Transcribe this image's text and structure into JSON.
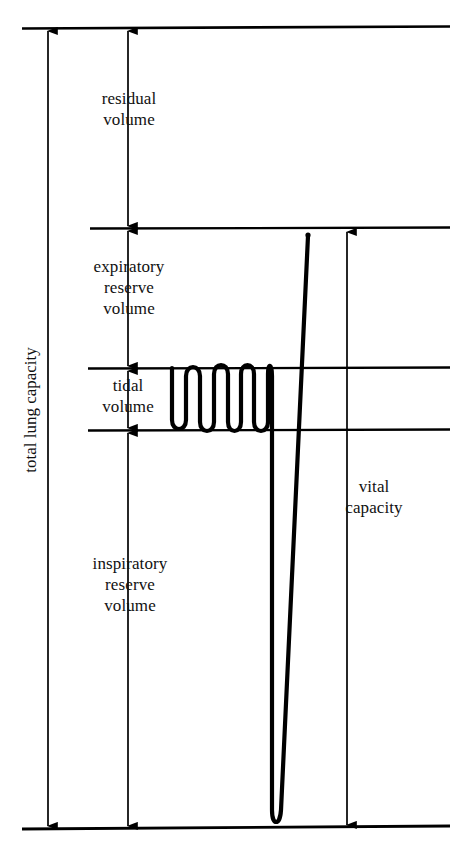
{
  "figure": {
    "ink_color": "#000000",
    "background_color": "#ffffff"
  },
  "labels": {
    "residual_volume": "residual\nvolume",
    "expiratory_reserve_volume": "expiratory\nreserve\nvolume",
    "tidal_volume": "tidal\nvolume",
    "inspiratory_reserve_volume": "inspiratory\nreserve\nvolume",
    "vital_capacity": "vital\ncapacity",
    "total_lung_capacity": "total lung capacity"
  },
  "chart_data": {
    "type": "line",
    "xlabel": "",
    "ylabel": "lung volume",
    "grid": false,
    "legend": null,
    "axis_orientation": "volume increases downward on screen; baseline at bottom is maximal inspiration level",
    "levels": [
      {
        "name": "total lung capacity top",
        "y": 28,
        "line_x_start": 22,
        "line_x_end": 450
      },
      {
        "name": "end of residual volume / top of expiratory reserve volume",
        "y": 228,
        "line_x_start": 90,
        "line_x_end": 450
      },
      {
        "name": "top of tidal volume band",
        "y": 368,
        "line_x_start": 88,
        "line_x_end": 450
      },
      {
        "name": "bottom of tidal volume band",
        "y": 430,
        "line_x_start": 88,
        "line_x_end": 450
      },
      {
        "name": "maximal inspiration baseline",
        "y": 828,
        "line_x_start": 22,
        "line_x_end": 450
      }
    ],
    "measure_arrows": [
      {
        "label": "total lung capacity",
        "x": 48,
        "y_top": 28,
        "y_bottom": 828,
        "heads": "both"
      },
      {
        "label": "residual volume",
        "x": 128,
        "y_top": 28,
        "y_bottom": 228,
        "heads": "both"
      },
      {
        "label": "expiratory reserve volume",
        "x": 128,
        "y_top": 228,
        "y_bottom": 368,
        "heads": "both"
      },
      {
        "label": "tidal volume",
        "x": 128,
        "y_top": 368,
        "y_bottom": 430,
        "heads": "both"
      },
      {
        "label": "inspiratory reserve volume",
        "x": 128,
        "y_top": 430,
        "y_bottom": 828,
        "heads": "both"
      },
      {
        "label": "vital capacity",
        "x": 347,
        "y_top": 232,
        "y_bottom": 828,
        "heads": "both"
      }
    ],
    "trace": {
      "name": "spirogram tracing",
      "tidal_breath_count": 6,
      "tidal_top_y": 368,
      "tidal_bottom_y": 430,
      "tidal_x_start": 172,
      "tidal_x_end": 268,
      "max_expiration_y": 828,
      "max_inspiration_y": 234,
      "deep_breath_x_down": 272,
      "deep_breath_x_up": 308
    }
  }
}
